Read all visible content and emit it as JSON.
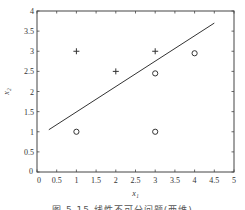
{
  "chart_data": {
    "type": "scatter",
    "title": "",
    "xlabel": "x₁",
    "ylabel": "x₂",
    "xlim": [
      0,
      5
    ],
    "ylim": [
      0,
      4
    ],
    "grid": false,
    "x_ticks": [
      "0",
      "0.5",
      "1",
      "1.5",
      "2",
      "2.5",
      "3",
      "3.5",
      "4",
      "4.5",
      "5"
    ],
    "y_ticks": [
      "0",
      "0.5",
      "1",
      "1.5",
      "2",
      "2.5",
      "3",
      "3.5",
      "4"
    ],
    "series": [
      {
        "name": "class +",
        "marker": "+",
        "points": [
          [
            1,
            3
          ],
          [
            2,
            2.5
          ],
          [
            3,
            3
          ]
        ]
      },
      {
        "name": "class o",
        "marker": "o",
        "points": [
          [
            1,
            1
          ],
          [
            3,
            2.45
          ],
          [
            3,
            1
          ],
          [
            4,
            2.95
          ]
        ]
      },
      {
        "name": "decision line",
        "type": "line",
        "points": [
          [
            0.3,
            1.05
          ],
          [
            4.5,
            3.7
          ]
        ]
      }
    ],
    "caption": "图 5.15  线性不可分问题(两维)"
  }
}
